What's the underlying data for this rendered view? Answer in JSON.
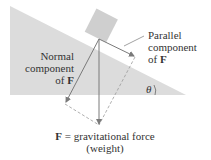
{
  "colors": {
    "incline_fill": "#dcdcdc",
    "block_fill": "#cfcfcf",
    "arrow_color": "#7a7a7a",
    "dashed_color": "#9a9a9a",
    "text_color": "#333333"
  },
  "labels": {
    "normal": {
      "line1": "Normal",
      "line2": "component",
      "line3_prefix": "of ",
      "line3_symbol": "F"
    },
    "parallel": {
      "line1": "Parallel",
      "line2": "component",
      "line3_prefix": "of ",
      "line3_symbol": "F"
    },
    "angle": "θ",
    "force": {
      "symbol": "F",
      "equals": " = gravitational force",
      "line2": "(weight)"
    }
  }
}
